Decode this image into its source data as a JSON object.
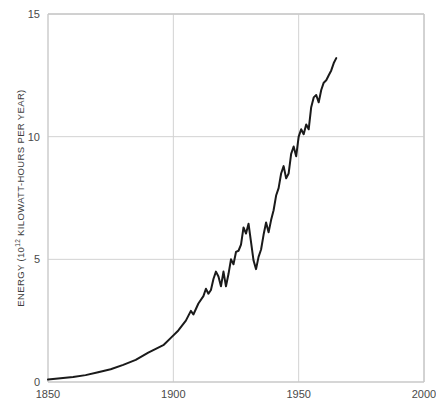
{
  "chart_data": {
    "type": "line",
    "title": "",
    "subtitle": "",
    "xlabel": "",
    "ylabel": "ENERGY (10",
    "ylabel_exponent": "12",
    "ylabel_tail": " KILOWATT-HOURS PER YEAR)",
    "ylabel_full": "ENERGY (10^12 KILOWATT-HOURS PER YEAR)",
    "xlim": [
      1850,
      2000
    ],
    "ylim": [
      0,
      15
    ],
    "xticks": [
      1850,
      1900,
      1950,
      2000
    ],
    "xtick_labels": [
      "1850",
      "1900",
      "1950",
      "2000"
    ],
    "yticks": [
      0,
      5,
      10,
      15
    ],
    "ytick_labels": [
      "0",
      "5",
      "10",
      "15"
    ],
    "grid": true,
    "grid_color": "#d2d2d2",
    "axis_color": "#c9c9c9",
    "line_color": "#1a1a1a",
    "line_width": 2.0,
    "legend": null,
    "legend_position": "none",
    "annotations": [],
    "series": [
      {
        "name": "World energy consumption",
        "x": [
          1850,
          1855,
          1860,
          1865,
          1870,
          1875,
          1880,
          1885,
          1890,
          1893,
          1896,
          1899,
          1902,
          1905,
          1907,
          1908,
          1910,
          1912,
          1913,
          1914,
          1915,
          1916,
          1917,
          1918,
          1919,
          1920,
          1921,
          1922,
          1923,
          1924,
          1925,
          1926,
          1927,
          1928,
          1929,
          1930,
          1931,
          1932,
          1933,
          1934,
          1935,
          1936,
          1937,
          1938,
          1939,
          1940,
          1941,
          1942,
          1943,
          1944,
          1945,
          1946,
          1947,
          1948,
          1949,
          1950,
          1951,
          1952,
          1953,
          1954,
          1955,
          1956,
          1957,
          1958,
          1959,
          1960,
          1961,
          1962,
          1963,
          1964,
          1965
        ],
        "y": [
          0.1,
          0.15,
          0.2,
          0.28,
          0.4,
          0.52,
          0.7,
          0.9,
          1.2,
          1.35,
          1.5,
          1.8,
          2.1,
          2.5,
          2.9,
          2.75,
          3.2,
          3.5,
          3.8,
          3.6,
          3.75,
          4.2,
          4.5,
          4.3,
          3.9,
          4.5,
          3.9,
          4.4,
          5.0,
          4.8,
          5.3,
          5.35,
          5.6,
          6.3,
          6.05,
          6.45,
          5.7,
          4.95,
          4.6,
          5.1,
          5.4,
          6.0,
          6.5,
          6.1,
          6.6,
          7.0,
          7.6,
          7.9,
          8.5,
          8.8,
          8.3,
          8.5,
          9.3,
          9.6,
          9.2,
          10.0,
          10.3,
          10.1,
          10.5,
          10.3,
          11.2,
          11.6,
          11.7,
          11.4,
          11.9,
          12.2,
          12.3,
          12.5,
          12.7,
          13.0,
          13.2
        ]
      }
    ]
  },
  "plot_geometry": {
    "left": 48,
    "right": 424,
    "top": 14,
    "bottom": 382
  }
}
